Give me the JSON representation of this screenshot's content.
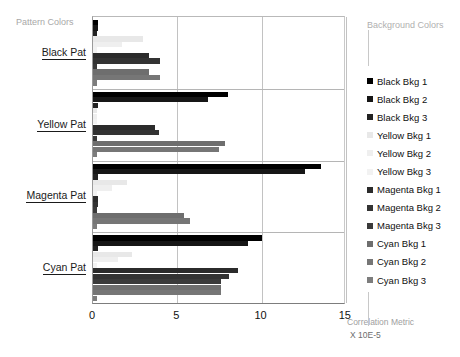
{
  "chart_data": {
    "type": "bar",
    "orientation": "horizontal",
    "title": "",
    "xlabel": "Correlation Metric",
    "xunit": "X 10E-5",
    "ylabel": "Pattern Colors",
    "legend_title": "Background Colors",
    "legend_position": "right",
    "grid": true,
    "xlim": [
      0,
      15
    ],
    "xticks": [
      0,
      5,
      10,
      15
    ],
    "xtick_labels": [
      "0",
      "5",
      "10",
      "15"
    ],
    "categories": [
      "Black Pat",
      "Yellow Pat",
      "Magenta Pat",
      "Cyan Pat"
    ],
    "series": [
      {
        "name": "Black Bkg 1",
        "color": "#000000",
        "values": [
          0.3,
          8.0,
          13.55,
          10.05
        ]
      },
      {
        "name": "Black Bkg 2",
        "color": "#161616",
        "values": [
          0.3,
          6.85,
          12.6,
          9.2
        ]
      },
      {
        "name": "Black Bkg 3",
        "color": "#222222",
        "values": [
          0.25,
          0.3,
          0.3,
          0.3
        ]
      },
      {
        "name": "Yellow Bkg 1",
        "color": "#e8e8e8",
        "values": [
          2.95,
          0.25,
          2.0,
          2.3
        ]
      },
      {
        "name": "Yellow Bkg 2",
        "color": "#efefef",
        "values": [
          1.7,
          0.25,
          1.15,
          1.5
        ]
      },
      {
        "name": "Yellow Bkg 3",
        "color": "#f2f2f2",
        "values": [
          0.25,
          0.25,
          0.25,
          0.25
        ]
      },
      {
        "name": "Magenta Bkg 1",
        "color": "#2b2b2b",
        "values": [
          3.3,
          3.65,
          0.3,
          8.6
        ]
      },
      {
        "name": "Magenta Bkg 2",
        "color": "#333333",
        "values": [
          3.95,
          3.9,
          0.3,
          8.05
        ]
      },
      {
        "name": "Magenta Bkg 3",
        "color": "#3a3a3a",
        "values": [
          0.25,
          0.25,
          0.25,
          7.6
        ]
      },
      {
        "name": "Cyan Bkg 1",
        "color": "#6e6e6e",
        "values": [
          3.3,
          7.85,
          5.4,
          7.6
        ]
      },
      {
        "name": "Cyan Bkg 2",
        "color": "#767676",
        "values": [
          4.0,
          7.5,
          5.75,
          7.6
        ]
      },
      {
        "name": "Cyan Bkg 3",
        "color": "#7d7d7d",
        "values": [
          0.25,
          0.25,
          0.25,
          0.25
        ]
      }
    ]
  },
  "axis": {
    "left_title": "Pattern Colors",
    "x_title": "Correlation Metric",
    "x_unit": "X 10E-5"
  },
  "legend": {
    "title": "Background Colors"
  }
}
